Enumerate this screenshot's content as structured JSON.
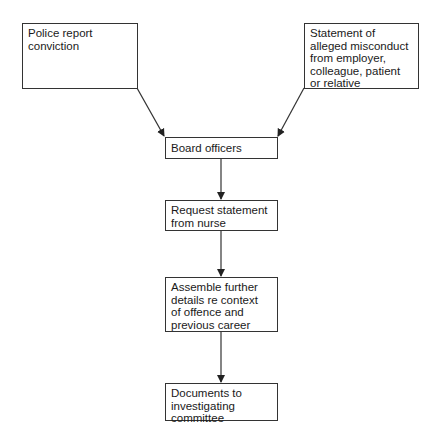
{
  "diagram": {
    "nodes": [
      {
        "id": "police",
        "lines": [
          "Police report",
          "conviction"
        ]
      },
      {
        "id": "statement",
        "lines": [
          "Statement of",
          "alleged misconduct",
          "from employer,",
          "colleague, patient",
          "or relative"
        ]
      },
      {
        "id": "board",
        "lines": [
          "Board officers"
        ]
      },
      {
        "id": "request",
        "lines": [
          "Request statement",
          "from nurse"
        ]
      },
      {
        "id": "assemble",
        "lines": [
          "Assemble further",
          "details re context",
          "of offence and",
          "previous career"
        ]
      },
      {
        "id": "documents",
        "lines": [
          "Documents to",
          "investigating",
          "committee"
        ]
      }
    ],
    "edges": [
      {
        "from": "police",
        "to": "board"
      },
      {
        "from": "statement",
        "to": "board"
      },
      {
        "from": "board",
        "to": "request"
      },
      {
        "from": "request",
        "to": "assemble"
      },
      {
        "from": "assemble",
        "to": "documents"
      }
    ],
    "colors": {
      "stroke": "#333333",
      "text": "#1a1a1a",
      "background": "#ffffff"
    }
  }
}
